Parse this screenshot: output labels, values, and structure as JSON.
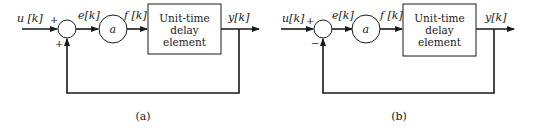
{
  "diagrams": [
    {
      "id": "a",
      "caption": "(a)",
      "input_label": "u [k]",
      "error_label": "e[k]",
      "gain_label": "a",
      "gain_output_label": "f [k]",
      "output_label": "y[k]",
      "block_lines": [
        "Unit-time",
        "delay",
        "element"
      ],
      "sum_sign_input": "+",
      "sum_sign_feedback": "+"
    },
    {
      "id": "b",
      "caption": "(b)",
      "input_label": "u[k]",
      "error_label": "e[k]",
      "gain_label": "a",
      "gain_output_label": "f [k]",
      "output_label": "y[k]",
      "block_lines": [
        "Unit-time",
        "delay",
        "element"
      ],
      "sum_sign_input": "+",
      "sum_sign_feedback": "−"
    }
  ]
}
